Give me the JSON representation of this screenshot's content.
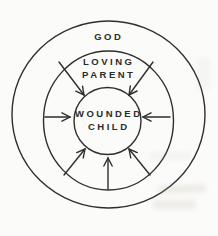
{
  "diagram": {
    "type": "concentric-circles",
    "rings": [
      {
        "name": "outer",
        "label": "GOD",
        "label_lines": [
          "GOD"
        ]
      },
      {
        "name": "middle",
        "label": "LOVING PARENT",
        "label_lines": [
          "LOVING",
          "PARENT"
        ]
      },
      {
        "name": "inner",
        "label": "WOUNDED CHILD",
        "label_lines": [
          "WOUNDED",
          "CHILD"
        ]
      }
    ],
    "arrows": {
      "count": 7,
      "style": "open-chevron-head",
      "points_toward": "inner circle",
      "directions": [
        "upper-left",
        "upper-right",
        "left",
        "right",
        "lower-left",
        "lower-right",
        "bottom"
      ]
    },
    "colors": {
      "background": "#fbfbf9",
      "line": "#2e2e2e",
      "text": "#2b2b2b"
    }
  }
}
